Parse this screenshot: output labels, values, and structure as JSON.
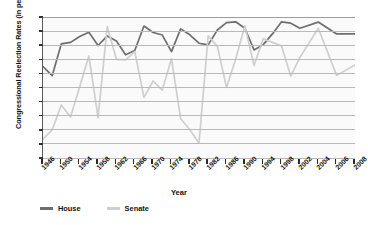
{
  "chart_data": {
    "type": "line",
    "title": "",
    "xlabel": "Year",
    "ylabel": "Congressional Reelection Rates (in percent)",
    "ylim": [
      50,
      100
    ],
    "ytick_step": 5,
    "yticks": [
      50,
      55,
      60,
      65,
      70,
      75,
      80,
      85,
      90,
      95,
      100
    ],
    "grid": true,
    "legend_position": "bottom-left",
    "x": [
      1946,
      1948,
      1950,
      1952,
      1954,
      1956,
      1958,
      1960,
      1962,
      1964,
      1966,
      1968,
      1970,
      1972,
      1974,
      1976,
      1978,
      1980,
      1982,
      1984,
      1986,
      1988,
      1990,
      1992,
      1994,
      1996,
      1998,
      2000,
      2002,
      2004,
      2006,
      2008
    ],
    "xtick_labels": [
      "1946",
      "1950",
      "1954",
      "1958",
      "1962",
      "1966",
      "1970",
      "1974",
      "1978",
      "1982",
      "1986",
      "1990",
      "1994",
      "1998",
      "2002",
      "2004",
      "2006",
      "2008"
    ],
    "series": [
      {
        "name": "House",
        "color": "#6e6e6e",
        "values": [
          82.4,
          79.2,
          90.5,
          91.0,
          93.1,
          94.6,
          89.9,
          93.3,
          91.5,
          86.6,
          88.1,
          96.8,
          94.5,
          93.6,
          87.7,
          95.8,
          93.7,
          90.7,
          90.1,
          95.4,
          98.0,
          98.3,
          96.0,
          88.3,
          90.2,
          94.0,
          98.3,
          97.8,
          96.0,
          98.2,
          94.0,
          94.0
        ]
      },
      {
        "name": "Senate",
        "color": "#cfcfcf",
        "values": [
          56.7,
          60.0,
          68.8,
          64.5,
          75.3,
          86.2,
          64.3,
          96.6,
          85.0,
          84.8,
          87.7,
          71.5,
          77.3,
          74.1,
          85.2,
          64.0,
          60.0,
          55.2,
          93.3,
          89.6,
          75.0,
          85.1,
          96.9,
          82.8,
          92.3,
          91.0,
          89.7,
          79.0,
          85.7,
          96.0,
          79.3,
          83.0
        ]
      }
    ]
  },
  "legend": [
    {
      "label": "House",
      "color": "#6e6e6e"
    },
    {
      "label": "Senate",
      "color": "#cfcfcf"
    }
  ]
}
